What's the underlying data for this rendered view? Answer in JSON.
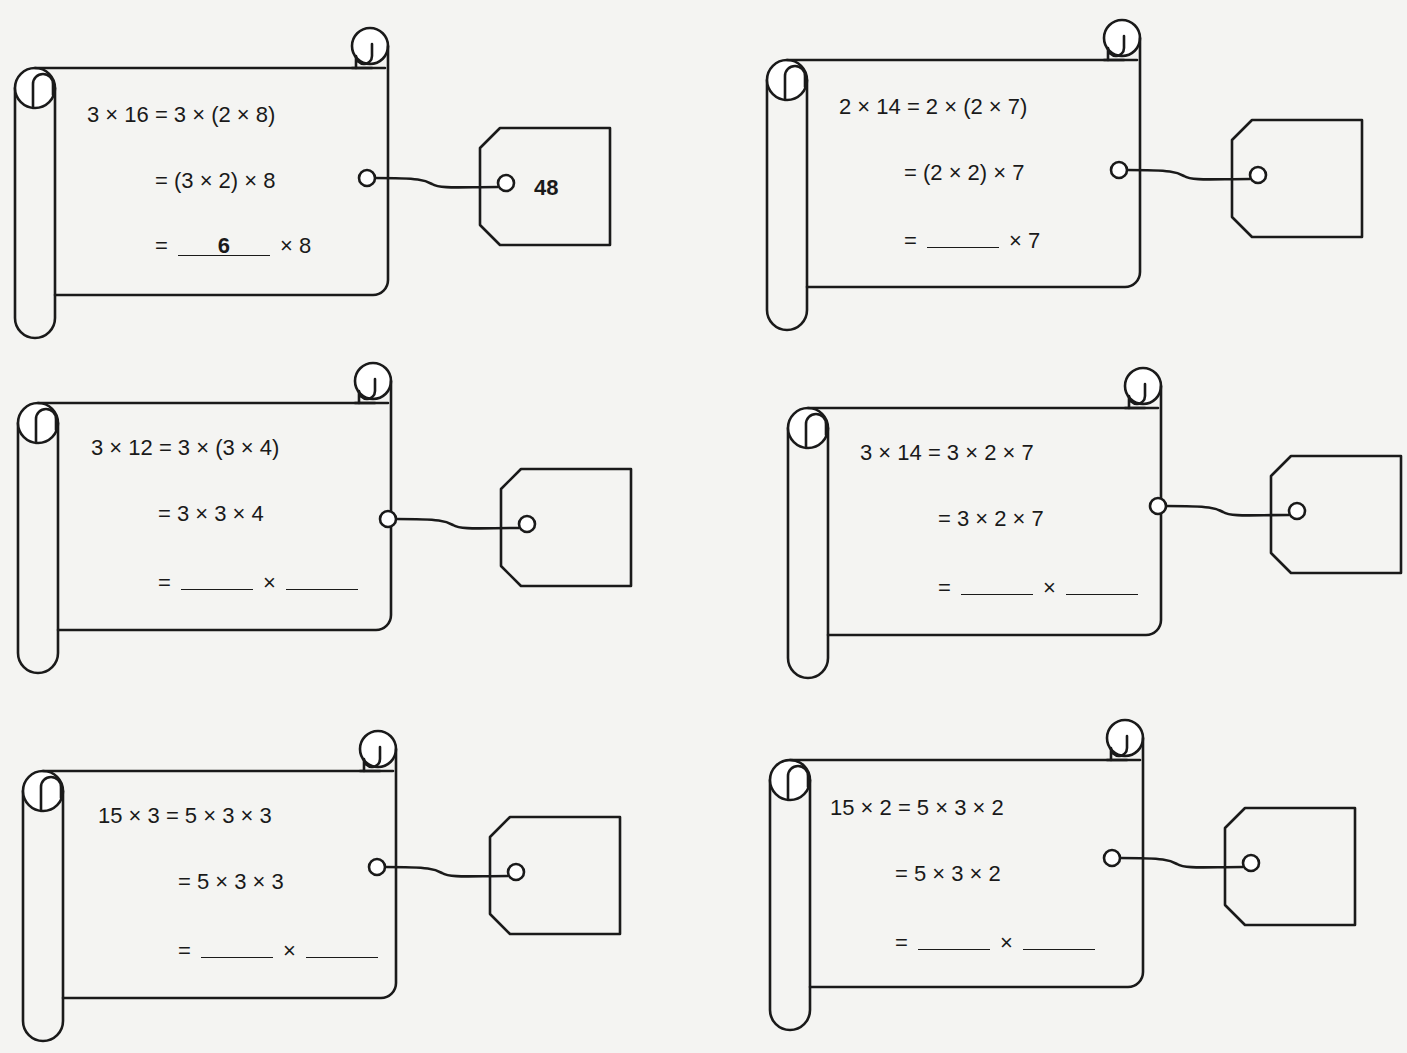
{
  "page": {
    "header_fragment": "",
    "background": "#f4f4f2",
    "ink_color": "#1a1a1a"
  },
  "exercises": [
    {
      "id": 1,
      "line1": "3 × 16 = 3 × (2 × 8)",
      "line2": "= (3 × 2) × 8",
      "line3_prefix": "=",
      "blank1": "6",
      "line3_suffix": "× 8",
      "tag_answer": "48"
    },
    {
      "id": 2,
      "line1": "2 × 14 = 2 × (2 × 7)",
      "line2": "= (2 × 2) × 7",
      "line3_prefix": "=",
      "blank1": "",
      "line3_suffix": "× 7",
      "tag_answer": ""
    },
    {
      "id": 3,
      "line1": "3 × 12 = 3 × (3 × 4)",
      "line2": "= 3 × 3 × 4",
      "line3_prefix": "=",
      "blank1": "",
      "times": "×",
      "blank2": "",
      "tag_answer": ""
    },
    {
      "id": 4,
      "line1": "3 × 14 = 3 × 2 × 7",
      "line2": "= 3 × 2 × 7",
      "line3_prefix": "=",
      "blank1": "",
      "times": "×",
      "blank2": "",
      "tag_answer": ""
    },
    {
      "id": 5,
      "line1": "15 × 3 = 5 × 3 × 3",
      "line2": "= 5 × 3 × 3",
      "line3_prefix": "=",
      "blank1": "",
      "times": "×",
      "blank2": "",
      "tag_answer": ""
    },
    {
      "id": 6,
      "line1": "15 × 2 = 5 × 3 × 2",
      "line2": "= 5 × 3 × 2",
      "line3_prefix": "=",
      "blank1": "",
      "times": "×",
      "blank2": "",
      "tag_answer": ""
    }
  ]
}
